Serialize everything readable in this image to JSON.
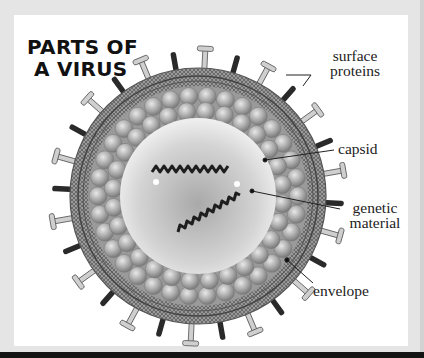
{
  "title": {
    "line1": "PARTS OF",
    "line2": "A VIRUS"
  },
  "labels": {
    "surface_proteins_line1": "surface",
    "surface_proteins_line2": "proteins",
    "capsid": "capsid",
    "genetic_material_line1": "genetic",
    "genetic_material_line2": "material",
    "envelope": "envelope"
  },
  "colors": {
    "background_frame": "#e5e5e5",
    "panel": "#ffffff",
    "envelope": "#8a8a8a",
    "capsid_spheres": "#b0b0b0",
    "core": "#dcdcdc",
    "protein_dark": "#2a2a2a",
    "protein_light": "#cfcfcf",
    "text": "#222222"
  }
}
